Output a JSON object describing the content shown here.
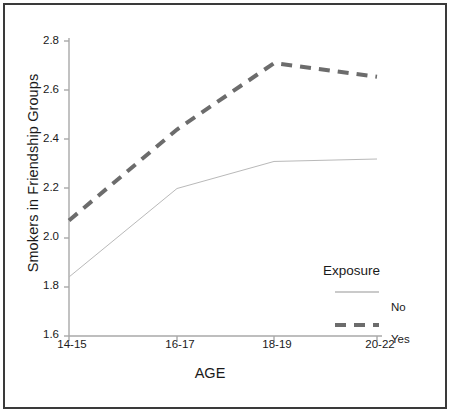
{
  "chart_data": {
    "type": "line",
    "title": "",
    "xlabel": "AGE",
    "ylabel": "Smokers in Friendship Groups",
    "categories": [
      "14-15",
      "16-17",
      "18-19",
      "20-22"
    ],
    "ylim": [
      1.6,
      2.8
    ],
    "yticks": [
      "1.6",
      "1.8",
      "2.0",
      "2.2",
      "2.4",
      "2.6",
      "2.8"
    ],
    "ytick_values": [
      1.6,
      1.8,
      2.0,
      2.2,
      2.4,
      2.6,
      2.8
    ],
    "grid": false,
    "legend_position": "right",
    "legend_title": "Exposure",
    "series": [
      {
        "name": "No",
        "values": [
          1.84,
          2.2,
          2.31,
          2.32
        ],
        "style": "solid",
        "color": "#b9b9b9",
        "width": 1
      },
      {
        "name": "Yes",
        "values": [
          2.07,
          2.44,
          2.71,
          2.655
        ],
        "style": "dashed",
        "color": "#6c6c6c",
        "width": 4
      }
    ]
  },
  "axes": {
    "y_title": "Smokers in Friendship Groups",
    "x_title": "AGE",
    "ytick_labels": [
      "2.8",
      "2.6",
      "2.4",
      "2.2",
      "2.0",
      "1.8",
      "1.6"
    ],
    "xtick_labels": [
      "14-15",
      "16-17",
      "18-19",
      "20-22"
    ]
  },
  "legend": {
    "title": "Exposure",
    "entries": [
      {
        "label": "No",
        "swatch": "thin-solid-line"
      },
      {
        "label": "Yes",
        "swatch": "thick-dashed-line"
      }
    ]
  },
  "colors": {
    "frame_border": "#3a3a3a",
    "axis_line": "#a8a8a8",
    "series_no": "#b9b9b9",
    "series_yes": "#6c6c6c",
    "text": "#1a1a1a",
    "background": "#ffffff"
  }
}
